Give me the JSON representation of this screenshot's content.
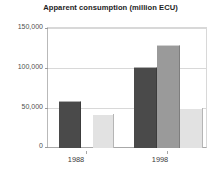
{
  "chart_data": {
    "type": "bar",
    "title": "Apparent consumption (million ECU)",
    "xlabel": "",
    "ylabel": "",
    "categories": [
      "1988",
      "1998"
    ],
    "ylim": [
      0,
      150000
    ],
    "yticks": [
      0,
      50000,
      100000,
      150000
    ],
    "ytick_labels": [
      "0",
      "50,000",
      "100,000",
      "150,000"
    ],
    "grid": true,
    "legend": "none",
    "series": [
      {
        "name": "series-1",
        "color": "#4a4a4a",
        "values": [
          58000,
          100000
        ]
      },
      {
        "name": "series-2",
        "color": "#9a9a9a",
        "values": [
          null,
          128000
        ]
      },
      {
        "name": "series-3",
        "color": "#e2e2e2",
        "values": [
          42000,
          50000
        ]
      }
    ],
    "bars": [
      {
        "group": "1988",
        "series": "series-1",
        "value": 58000,
        "color": "#4a4a4a"
      },
      {
        "group": "1988",
        "series": "series-3",
        "value": 42000,
        "color": "#e2e2e2"
      },
      {
        "group": "1998",
        "series": "series-1",
        "value": 100000,
        "color": "#4a4a4a"
      },
      {
        "group": "1998",
        "series": "series-2",
        "value": 128000,
        "color": "#9a9a9a"
      },
      {
        "group": "1998",
        "series": "series-3",
        "value": 50000,
        "color": "#e2e2e2"
      }
    ],
    "colors": {
      "dark": "#4a4a4a",
      "medium": "#9a9a9a",
      "light": "#e2e2e2",
      "grid": "#d8d8d8",
      "axis": "#a8a8a8",
      "text": "#3a3a3a",
      "background": "#ffffff"
    }
  },
  "ticks": {
    "t0": "0",
    "t1": "50,000",
    "t2": "100,000",
    "t3": "150,000"
  },
  "xaxis": {
    "label_1988": "1988",
    "label_1998": "1998"
  }
}
